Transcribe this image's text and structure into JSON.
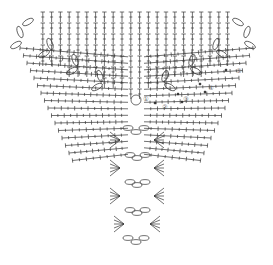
{
  "diagram": {
    "type": "crochet-chart",
    "shape": "inverted-triangle",
    "stroke_color": "#222222",
    "background": "#ffffff",
    "row_labels": [
      "①",
      "②",
      "③",
      "④",
      "⑤"
    ],
    "symbols": [
      "chain-loop",
      "double-crochet",
      "slip-stitch-dot"
    ]
  }
}
